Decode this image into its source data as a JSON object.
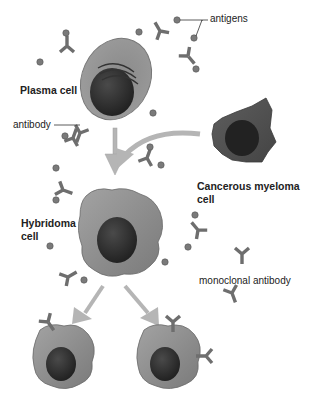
{
  "diagram": {
    "colors": {
      "background": "#ffffff",
      "cell_body": "#8f8f8f",
      "cell_dark": "#5c5c5c",
      "nucleus": "#2e2e2e",
      "antibody": "#6e6e6e",
      "antigen": "#7a7a7a",
      "arrow": "#b5b5b5",
      "label_text": "#222222"
    },
    "labels": {
      "antigens": "antigens",
      "plasma_cell": "Plasma cell",
      "antibody": "antibody",
      "cancerous_myeloma_line1": "Cancerous myeloma",
      "cancerous_myeloma_line2": "cell",
      "hybridoma_line1": "Hybridoma",
      "hybridoma_line2": "cell",
      "monoclonal_antibody": "monoclonal antibody"
    },
    "nodes": [
      {
        "id": "plasma-cell",
        "label": "Plasma cell",
        "shape": "oval"
      },
      {
        "id": "myeloma-cell",
        "label": "Cancerous myeloma cell",
        "shape": "irregular"
      },
      {
        "id": "hybridoma-cell",
        "label": "Hybridoma cell",
        "shape": "irregular"
      },
      {
        "id": "clone-left",
        "label": "",
        "shape": "irregular"
      },
      {
        "id": "clone-right",
        "label": "",
        "shape": "irregular"
      }
    ],
    "edges": [
      {
        "from": "plasma-cell",
        "to": "hybridoma-cell"
      },
      {
        "from": "myeloma-cell",
        "to": "hybridoma-cell"
      },
      {
        "from": "hybridoma-cell",
        "to": "clone-left"
      },
      {
        "from": "hybridoma-cell",
        "to": "clone-right"
      }
    ]
  }
}
